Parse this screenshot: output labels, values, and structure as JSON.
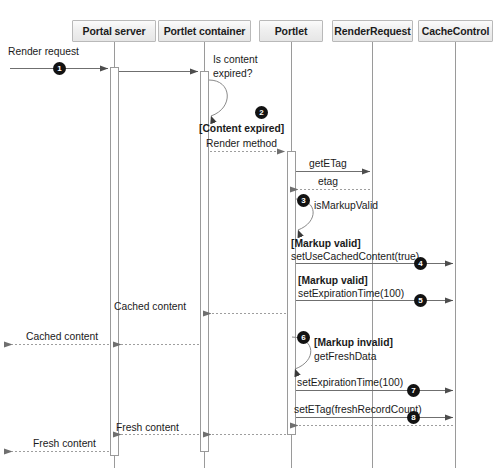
{
  "diagram": {
    "type": "uml-sequence-diagram",
    "background_color": "#ffffff",
    "line_color": "#777777",
    "badge_color": "#121212",
    "header_fill": "#ececec",
    "header_border": "#b9b9b9"
  },
  "lifelines": [
    {
      "id": "portal",
      "label": "Portal server",
      "x": 114,
      "box_left": 72,
      "box_width": 84,
      "act_left": 110,
      "act_width": 9
    },
    {
      "id": "container",
      "label": "Portlet container",
      "x": 204,
      "box_left": 158,
      "box_width": 93,
      "act_left": 200,
      "act_width": 9
    },
    {
      "id": "portlet",
      "label": "Portlet",
      "x": 291,
      "box_left": 259,
      "box_width": 64,
      "act_left": 287,
      "act_width": 9
    },
    {
      "id": "renderrequest",
      "label": "RenderRequest",
      "x": 372,
      "box_left": 332,
      "box_width": 81,
      "act_left": 368,
      "act_width": 0
    },
    {
      "id": "cachecontrol",
      "label": "CacheControl",
      "x": 455,
      "box_left": 418,
      "box_width": 75,
      "act_left": 451,
      "act_width": 0
    }
  ],
  "messages": [
    {
      "n": 1,
      "label": "Render request",
      "from": "external",
      "to": "portal",
      "kind": "call",
      "y": 68,
      "badge": true
    },
    {
      "n": null,
      "label": "",
      "from": "portal",
      "to": "container",
      "kind": "call",
      "y": 71,
      "badge": false
    },
    {
      "n": null,
      "label": "Is content\nexpired?",
      "from": "container",
      "to": "container",
      "kind": "self",
      "y": 78,
      "badge": false
    },
    {
      "n": 2,
      "label": "[Content expired]\nRender method",
      "from": "container",
      "to": "portlet",
      "kind": "return",
      "y": 151,
      "badge": true
    },
    {
      "n": null,
      "label": "getETag",
      "from": "portlet",
      "to": "renderrequest",
      "kind": "call",
      "y": 172,
      "badge": false
    },
    {
      "n": null,
      "label": "etag",
      "from": "renderrequest",
      "to": "portlet",
      "kind": "return",
      "y": 191,
      "badge": false
    },
    {
      "n": 3,
      "label": "isMarkupValid",
      "from": "portlet",
      "to": "portlet",
      "kind": "self",
      "y": 203,
      "badge": true
    },
    {
      "n": 4,
      "label": "[Markup valid]\nsetUseCachedContent(true)",
      "from": "portlet",
      "to": "cachecontrol",
      "kind": "call",
      "y": 263,
      "badge": true
    },
    {
      "n": 5,
      "label": "[Markup valid]\nsetExpirationTime(100)",
      "from": "portlet",
      "to": "cachecontrol",
      "kind": "call",
      "y": 300,
      "badge": true
    },
    {
      "n": null,
      "label": "Cached content",
      "from": "portlet",
      "to": "container",
      "kind": "return",
      "y": 313,
      "badge": false
    },
    {
      "n": null,
      "label": "Cached content",
      "from": "container",
      "to": "external",
      "kind": "return",
      "y": 344,
      "badge": false
    },
    {
      "n": 6,
      "label": "[Markup invalid]\ngetFreshData",
      "from": "portlet",
      "to": "portlet",
      "kind": "self",
      "y": 338,
      "badge": true
    },
    {
      "n": 7,
      "label": "setExpirationTime(100)",
      "from": "portlet",
      "to": "cachecontrol",
      "kind": "call",
      "y": 390,
      "badge": true
    },
    {
      "n": 8,
      "label": "setETag(freshRecordCount)",
      "from": "portlet",
      "to": "cachecontrol",
      "kind": "call",
      "y": 417,
      "badge": true
    },
    {
      "n": null,
      "label": "Fresh content",
      "from": "portlet",
      "to": "container",
      "kind": "return",
      "y": 434,
      "badge": false
    },
    {
      "n": null,
      "label": "Fresh content",
      "from": "container",
      "to": "external",
      "kind": "return",
      "y": 451,
      "badge": false
    }
  ],
  "labels": {
    "render_request": "Render request",
    "is_content_expired_1": "Is content",
    "is_content_expired_2": "expired?",
    "content_expired_guard": "[Content expired]",
    "render_method": "Render method",
    "get_etag": "getETag",
    "etag": "etag",
    "is_markup_valid": "isMarkupValid",
    "markup_valid_guard_1": "[Markup valid]",
    "set_use_cached_content": "setUseCachedContent(true)",
    "markup_valid_guard_2": "[Markup valid]",
    "set_expiration_time_1": "setExpirationTime(100)",
    "cached_content_1": "Cached content",
    "cached_content_2": "Cached content",
    "markup_invalid_guard": "[Markup invalid]",
    "get_fresh_data": "getFreshData",
    "set_expiration_time_2": "setExpirationTime(100)",
    "set_etag": "setETag(freshRecordCount)",
    "fresh_content_1": "Fresh content",
    "fresh_content_2": "Fresh content"
  },
  "badges": {
    "b1": "1",
    "b2": "2",
    "b3": "3",
    "b4": "4",
    "b5": "5",
    "b6": "6",
    "b7": "7",
    "b8": "8"
  }
}
